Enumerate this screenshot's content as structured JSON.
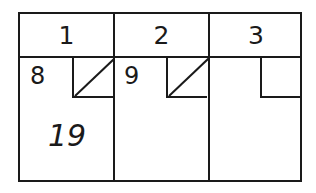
{
  "table": {
    "columns": [
      {
        "header": "1",
        "left_value": "8",
        "corner_slashed": true,
        "main_value": "19"
      },
      {
        "header": "2",
        "left_value": "9",
        "corner_slashed": true,
        "main_value": ""
      },
      {
        "header": "3",
        "left_value": "",
        "corner_slashed": false,
        "main_value": ""
      }
    ]
  }
}
